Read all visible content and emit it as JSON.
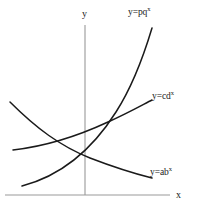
{
  "chart_data": {
    "type": "line",
    "title": "",
    "subtitle": "",
    "xlabel": "x",
    "ylabel": "y",
    "grid": false,
    "legend_position": "inline-curve-end",
    "axes": {
      "x_axis_label": "x",
      "y_axis_label": "y",
      "x_axis_color": "#999999",
      "y_axis_color": "#999999",
      "x_axis_start_px": [
        5,
        195
      ],
      "x_axis_end_px": [
        170,
        195
      ],
      "y_axis_start_px": [
        85,
        25
      ],
      "y_axis_end_px": [
        85,
        195
      ],
      "origin_px": [
        85,
        195
      ]
    },
    "curve_color": "#1a1a1a",
    "series": [
      {
        "name": "y=pq^x",
        "label_html": "y=pq<sup>x</sup>",
        "kind": "exponential-growth-fast",
        "description": "steep increasing exponential curve",
        "path_px": "M 22,186 C 60,176 92,150 116,112 C 134,84 146,48 152,28",
        "label_px": [
          128,
          8
        ]
      },
      {
        "name": "y=cd^x",
        "label_html": "y=cd<sup>x</sup>",
        "kind": "exponential-growth-slow",
        "description": "gentler increasing exponential curve",
        "path_px": "M 13,150 C 48,146 80,135 108,122 C 130,112 144,104 152,100",
        "label_px": [
          152,
          92
        ]
      },
      {
        "name": "y=ab^x",
        "label_html": "y=ab<sup>x</sup>",
        "kind": "exponential-decay",
        "description": "decreasing exponential decay curve",
        "path_px": "M 10,102 C 36,128 60,146 90,158 C 116,168 136,174 152,178",
        "label_px": [
          150,
          168
        ]
      }
    ],
    "annotations": [
      {
        "text": "y",
        "role": "y-axis-tip-label",
        "px": [
          82,
          9
        ]
      },
      {
        "text": "x",
        "role": "x-axis-tip-label",
        "px": [
          176,
          190
        ]
      }
    ]
  }
}
